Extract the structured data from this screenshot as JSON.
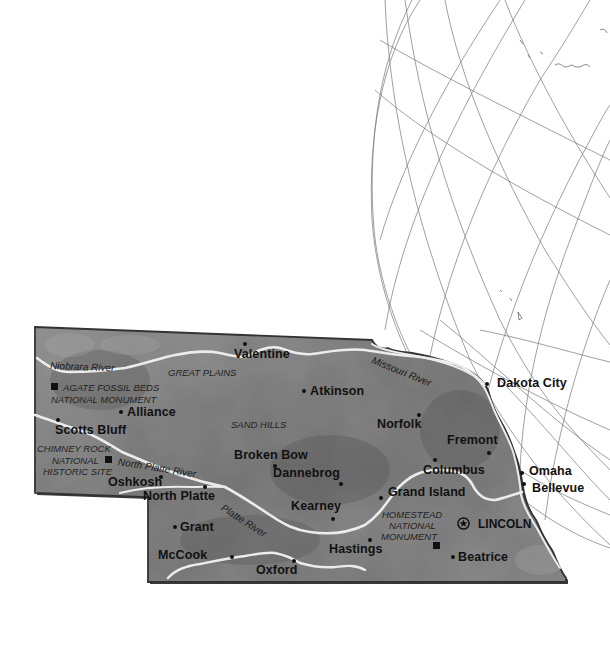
{
  "map": {
    "state": "Nebraska",
    "colors": {
      "land": "#7a7a7a",
      "land_dark": "#5e5e5e",
      "land_light": "#9a9a9a",
      "river": "#e8e8e8",
      "border": "#3a3a3a",
      "globe_lines": "#777777",
      "text": "#111111"
    },
    "regions": {
      "great_plains": "GREAT PLAINS",
      "sand_hills": "SAND HILLS"
    },
    "rivers": {
      "niobrara": "Niobrara River",
      "north_platte": "North Platte River",
      "platte": "Platte River",
      "missouri": "Missouri River"
    },
    "sites": {
      "agate_line1": "AGATE FOSSIL BEDS",
      "agate_line2": "NATIONAL MONUMENT",
      "chimney_line1": "CHIMNEY ROCK",
      "chimney_line2": "NATIONAL",
      "chimney_line3": "HISTORIC SITE",
      "homestead_line1": "HOMESTEAD",
      "homestead_line2": "NATIONAL",
      "homestead_line3": "MONUMENT"
    },
    "capital": {
      "name": "LINCOLN",
      "icon": "star-capital-icon"
    },
    "cities": {
      "valentine": "Valentine",
      "atkinson": "Atkinson",
      "dakota_city": "Dakota City",
      "alliance": "Alliance",
      "scotts_bluff": "Scotts Bluff",
      "norfolk": "Norfolk",
      "fremont": "Fremont",
      "broken_bow": "Broken Bow",
      "dannebrog": "Dannebrog",
      "columbus": "Columbus",
      "omaha": "Omaha",
      "bellevue": "Bellevue",
      "oshkosh": "Oshkosh",
      "north_platte": "North Platte",
      "grand_island": "Grand Island",
      "kearney": "Kearney",
      "grant": "Grant",
      "mccook": "McCook",
      "hastings": "Hastings",
      "oxford": "Oxford",
      "beatrice": "Beatrice"
    }
  }
}
